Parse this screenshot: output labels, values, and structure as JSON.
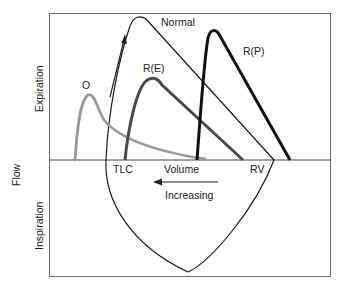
{
  "figure": {
    "y_axis_label": "Flow",
    "upper_region_label": "Expiration",
    "lower_region_label": "Inspiration",
    "x_axis_label": "Volume",
    "left_volume_label": "TLC",
    "right_volume_label": "RV",
    "direction_label": "Increasing",
    "curves": [
      {
        "id": "normal",
        "label": "Normal",
        "color": "#1a1a1a",
        "width": 1.2
      },
      {
        "id": "O",
        "label": "O",
        "color": "#9a9a9a",
        "width": 2.8
      },
      {
        "id": "RE",
        "label": "R(E)",
        "color": "#4a4a4a",
        "width": 3
      },
      {
        "id": "RP",
        "label": "R(P)",
        "color": "#111111",
        "width": 3
      }
    ],
    "colors": {
      "frame": "#555555",
      "axis": "#333333",
      "background": "#ffffff"
    }
  }
}
